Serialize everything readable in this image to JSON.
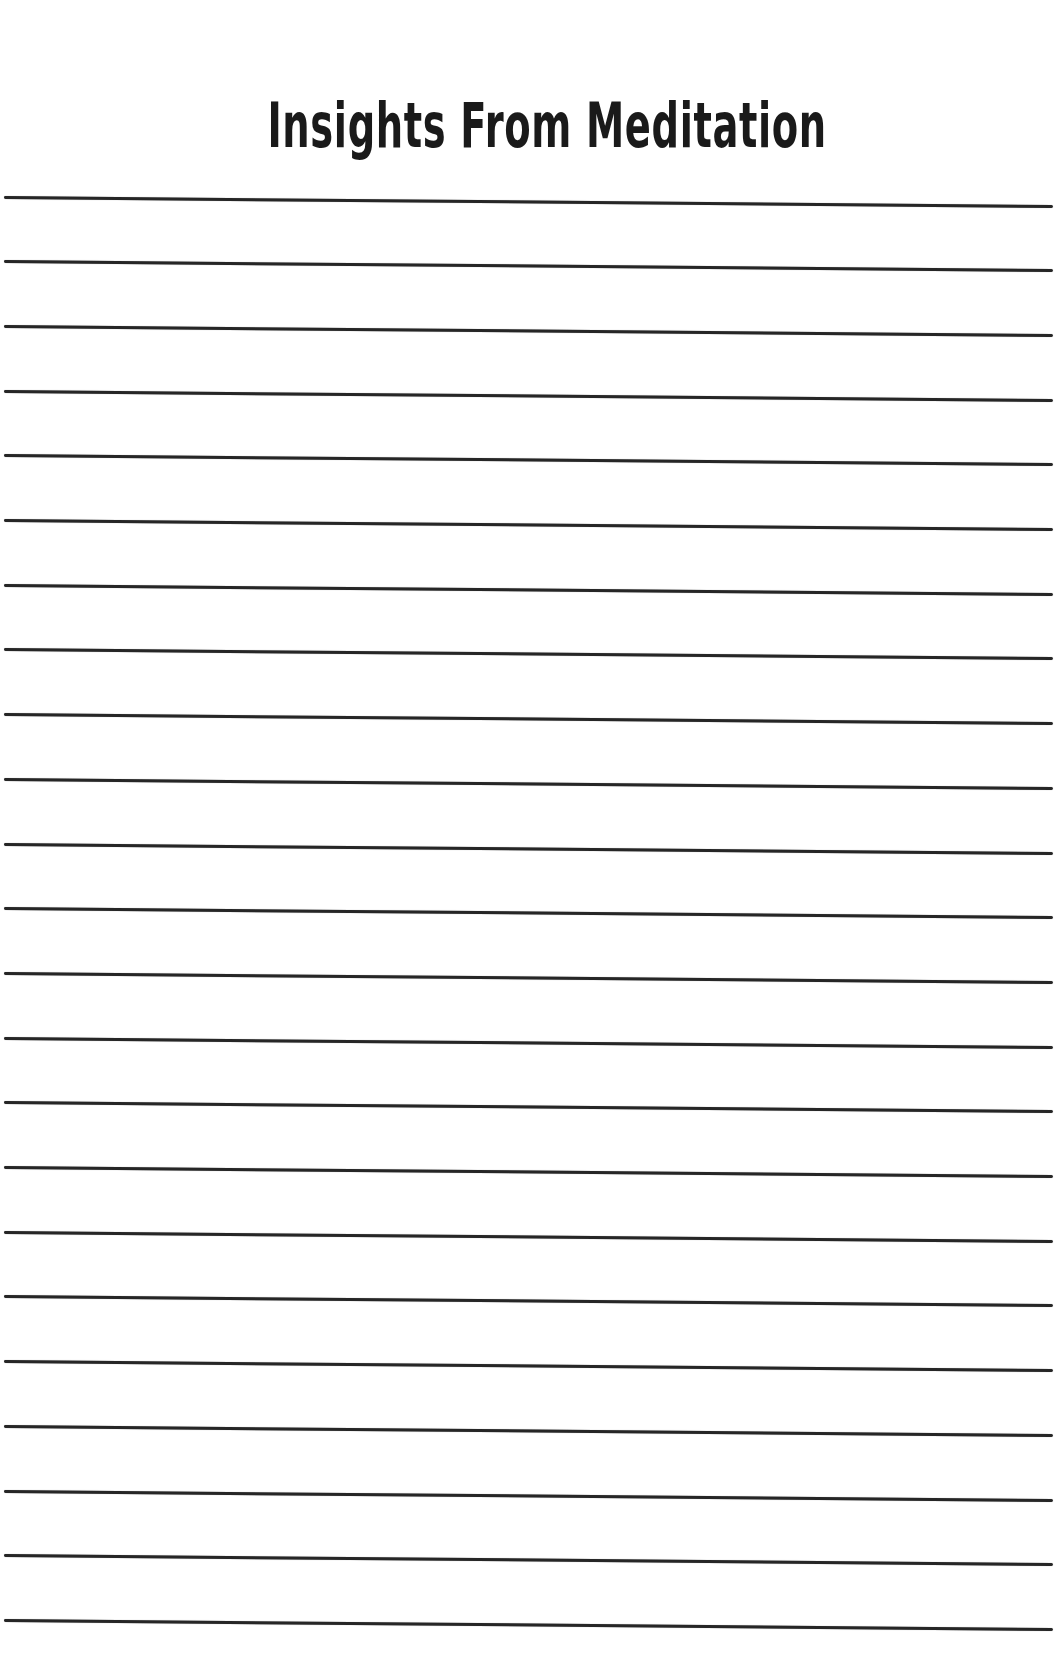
{
  "page": {
    "title": "Insights From Meditation",
    "background_color": "#ffffff",
    "ink_color": "#262626"
  },
  "ruled_lines": {
    "count": 23,
    "first_line_y": 197,
    "spacing_px": 64.7,
    "slope_drop_px": 9
  }
}
